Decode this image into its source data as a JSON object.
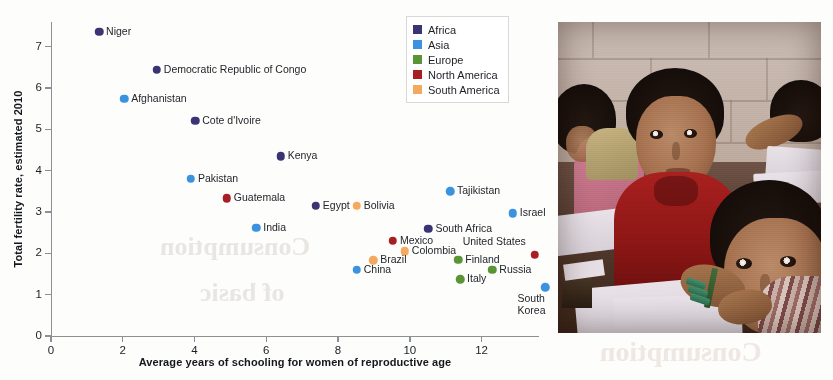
{
  "chart_data": {
    "type": "scatter",
    "title": "",
    "xlabel": "Average years of schooling for women of reproductive age",
    "ylabel": "Total fertility rate, estimated 2010",
    "xlim": [
      0,
      13.6
    ],
    "ylim": [
      0,
      7.6
    ],
    "xticks": [
      0,
      2,
      4,
      6,
      8,
      10,
      12
    ],
    "yticks": [
      0,
      1,
      2,
      3,
      4,
      5,
      6,
      7
    ],
    "grid": false,
    "legend_position": "top-right",
    "legend": [
      {
        "label": "Africa",
        "color": "#3b3474"
      },
      {
        "label": "Asia",
        "color": "#3b93e0"
      },
      {
        "label": "Europe",
        "color": "#5a9434"
      },
      {
        "label": "North America",
        "color": "#a81f23"
      },
      {
        "label": "South America",
        "color": "#f5a95e"
      }
    ],
    "points": [
      {
        "name": "Niger",
        "x": 1.34,
        "y": 7.36,
        "group": "Africa",
        "color": "#3b3474",
        "label_side": "right"
      },
      {
        "name": "Democratic Republic of Congo",
        "x": 2.95,
        "y": 6.45,
        "group": "Africa",
        "color": "#3b3474",
        "label_side": "right"
      },
      {
        "name": "Afghanistan",
        "x": 2.04,
        "y": 5.74,
        "group": "Asia",
        "color": "#3b93e0",
        "label_side": "right"
      },
      {
        "name": "Cote d'Ivoire",
        "x": 4.02,
        "y": 5.21,
        "group": "Africa",
        "color": "#3b3474",
        "label_side": "right"
      },
      {
        "name": "Kenya",
        "x": 6.4,
        "y": 4.35,
        "group": "Africa",
        "color": "#3b3474",
        "label_side": "right"
      },
      {
        "name": "Pakistan",
        "x": 3.9,
        "y": 3.81,
        "group": "Asia",
        "color": "#3b93e0",
        "label_side": "right"
      },
      {
        "name": "Guatemala",
        "x": 4.9,
        "y": 3.34,
        "group": "North America",
        "color": "#a81f23",
        "label_side": "right"
      },
      {
        "name": "Egypt",
        "x": 7.38,
        "y": 3.15,
        "group": "Africa",
        "color": "#3b3474",
        "label_side": "right"
      },
      {
        "name": "Bolivia",
        "x": 8.52,
        "y": 3.15,
        "group": "South America",
        "color": "#f5a95e",
        "label_side": "right"
      },
      {
        "name": "Tajikistan",
        "x": 11.12,
        "y": 3.5,
        "group": "Asia",
        "color": "#3b93e0",
        "label_side": "right"
      },
      {
        "name": "Israel",
        "x": 12.87,
        "y": 2.97,
        "group": "Asia",
        "color": "#3b93e0",
        "label_side": "right"
      },
      {
        "name": "India",
        "x": 5.72,
        "y": 2.62,
        "group": "Asia",
        "color": "#3b93e0",
        "label_side": "right"
      },
      {
        "name": "South Africa",
        "x": 10.52,
        "y": 2.6,
        "group": "Africa",
        "color": "#3b3474",
        "label_side": "right"
      },
      {
        "name": "Mexico",
        "x": 9.53,
        "y": 2.3,
        "group": "North America",
        "color": "#a81f23",
        "label_side": "right"
      },
      {
        "name": "United States",
        "x": 13.48,
        "y": 1.97,
        "group": "North America",
        "color": "#a81f23",
        "label_side": "above-left"
      },
      {
        "name": "Colombia",
        "x": 9.86,
        "y": 2.05,
        "group": "South America",
        "color": "#f5a95e",
        "label_side": "right"
      },
      {
        "name": "Brazil",
        "x": 8.98,
        "y": 1.83,
        "group": "South America",
        "color": "#f5a95e",
        "label_side": "right"
      },
      {
        "name": "Finland",
        "x": 11.35,
        "y": 1.85,
        "group": "Europe",
        "color": "#5a9434",
        "label_side": "right"
      },
      {
        "name": "China",
        "x": 8.52,
        "y": 1.6,
        "group": "Asia",
        "color": "#3b93e0",
        "label_side": "right"
      },
      {
        "name": "Russia",
        "x": 12.3,
        "y": 1.6,
        "group": "Europe",
        "color": "#5a9434",
        "label_side": "right"
      },
      {
        "name": "Italy",
        "x": 11.4,
        "y": 1.37,
        "group": "Europe",
        "color": "#5a9434",
        "label_side": "right"
      },
      {
        "name": "South\nKorea",
        "x": 13.78,
        "y": 1.18,
        "group": "Asia",
        "color": "#3b93e0",
        "label_side": "below-left"
      }
    ]
  },
  "photo": {
    "alt": "Children seated at desks in a classroom, writing in notebooks"
  },
  "bleed": {
    "line1": "Consumption",
    "line2": "of basic",
    "line3": "Consumption",
    "line4": "reverse page text"
  }
}
